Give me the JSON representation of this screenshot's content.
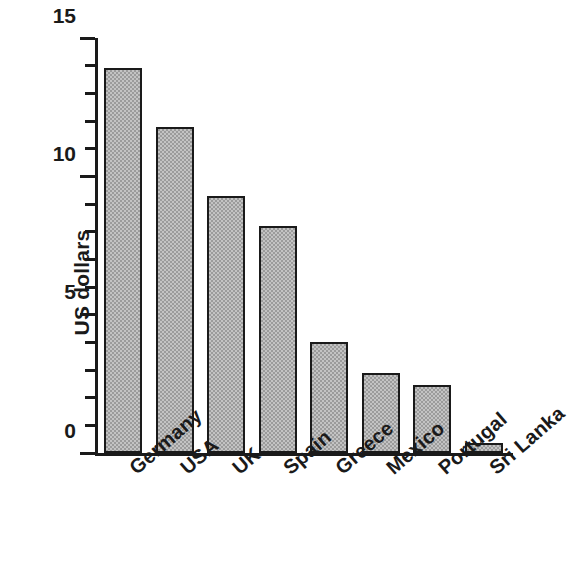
{
  "chart_data": {
    "type": "bar",
    "title": "",
    "subtitle": "",
    "xlabel": "",
    "ylabel": "US dollars",
    "categories": [
      "Germany",
      "USA",
      "UK",
      "Spain",
      "Greece",
      "Mexico",
      "Portugal",
      "Sri Lanka"
    ],
    "values": [
      13.9,
      11.8,
      9.3,
      8.2,
      4.0,
      2.9,
      2.45,
      0.35
    ],
    "ylim": [
      0,
      15
    ],
    "y_major_ticks": [
      0,
      5,
      10,
      15
    ],
    "y_major_tick_labels": [
      "0",
      "5",
      "10",
      "15"
    ],
    "y_minor_tick_step": 1,
    "grid": false,
    "legend": null,
    "legend_position": "none",
    "bar_fill_color": "#9b9b9b",
    "bar_edge_color": "#1a1a1a",
    "background_color": "#ffffff",
    "axis_color": "#1a1a1a",
    "xtick_label_rotation": -41,
    "annotations": []
  }
}
